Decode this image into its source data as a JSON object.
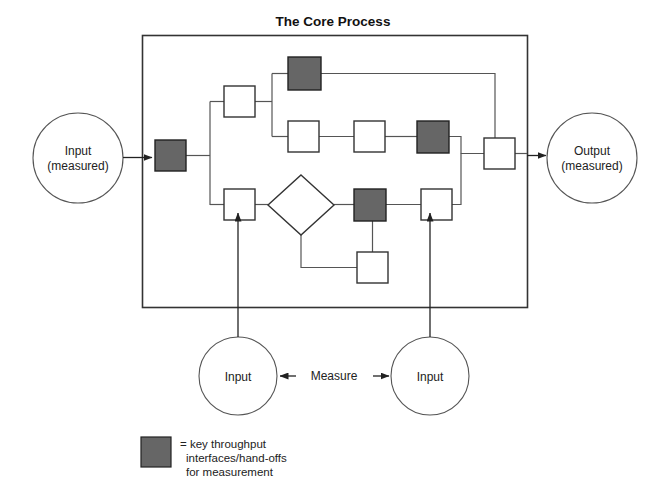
{
  "title": "The Core Process",
  "colors": {
    "key_node_fill": "#666666",
    "plain_node_fill": "#ffffff",
    "node_stroke": "#333333",
    "connector": "#555555",
    "text": "#111111",
    "background": "#ffffff"
  },
  "endpoints": {
    "input": {
      "line1": "Input",
      "line2": "(measured)"
    },
    "output": {
      "line1": "Output",
      "line2": "(measured)"
    }
  },
  "measurement_inputs": {
    "left_label": "Input",
    "right_label": "Input",
    "connector_label": "Measure"
  },
  "legend": {
    "line1": "= key throughput",
    "line2": "interfaces/hand-offs",
    "line3": "for measurement",
    "swatch_color": "#666666"
  },
  "process_nodes": [
    {
      "id": "entry",
      "kind": "key",
      "shape": "square",
      "x": 155,
      "y": 140,
      "size": 31
    },
    {
      "id": "upper-branch",
      "kind": "plain",
      "shape": "square",
      "x": 224,
      "y": 86,
      "size": 31
    },
    {
      "id": "upper-key",
      "kind": "key",
      "shape": "square",
      "x": 288,
      "y": 57,
      "size": 33
    },
    {
      "id": "mid-a",
      "kind": "plain",
      "shape": "square",
      "x": 288,
      "y": 121,
      "size": 31
    },
    {
      "id": "mid-b",
      "kind": "plain",
      "shape": "square",
      "x": 354,
      "y": 121,
      "size": 31
    },
    {
      "id": "mid-key",
      "kind": "key",
      "shape": "square",
      "x": 417,
      "y": 121,
      "size": 32
    },
    {
      "id": "merge",
      "kind": "plain",
      "shape": "square",
      "x": 484,
      "y": 138,
      "size": 31
    },
    {
      "id": "lower-entry",
      "kind": "plain",
      "shape": "square",
      "x": 224,
      "y": 189,
      "size": 31
    },
    {
      "id": "decision",
      "kind": "plain",
      "shape": "diamond",
      "cx": 301,
      "cy": 205,
      "rx": 33,
      "ry": 30
    },
    {
      "id": "lower-key",
      "kind": "key",
      "shape": "square",
      "x": 354,
      "y": 189,
      "size": 32
    },
    {
      "id": "lower-exit",
      "kind": "plain",
      "shape": "square",
      "x": 421,
      "y": 189,
      "size": 31
    },
    {
      "id": "loop-back",
      "kind": "plain",
      "shape": "square",
      "x": 357,
      "y": 252,
      "size": 31
    }
  ],
  "frame": {
    "x": 142,
    "y": 35,
    "width": 385,
    "height": 272
  }
}
